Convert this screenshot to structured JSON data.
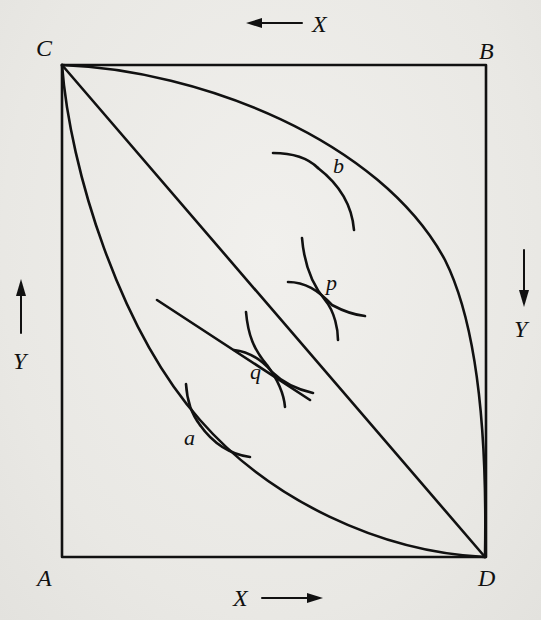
{
  "figure": {
    "type": "edgeworth-box-contract-curve",
    "corners": {
      "top_left": "C",
      "top_right": "B",
      "bottom_left": "A",
      "bottom_right": "D"
    },
    "axis_labels": {
      "top": "X",
      "bottom": "X",
      "left": "Y",
      "right": "Y"
    },
    "axis_arrows": {
      "top": "left",
      "bottom": "right",
      "left": "up",
      "right": "down"
    },
    "points": {
      "a": "a",
      "q": "q",
      "p": "p",
      "b": "b"
    },
    "curves": [
      "upper-boundary-curve-C-to-D",
      "diagonal-C-to-D",
      "lower-boundary-curve-C-to-D",
      "contract-path-segment"
    ],
    "colors": {
      "ink": "#111111",
      "paper": "#ecebe8"
    }
  }
}
